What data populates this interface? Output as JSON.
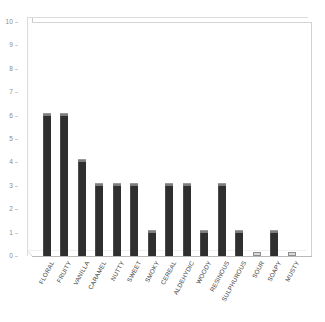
{
  "chart_data": {
    "type": "bar",
    "title": "",
    "subtitle": "",
    "xlabel": "",
    "ylabel": "",
    "ylim": [
      0,
      10
    ],
    "ytick_step": 1,
    "yticks": [
      0,
      1,
      2,
      3,
      4,
      5,
      6,
      7,
      8,
      9,
      10
    ],
    "ytick_labels": [
      "0",
      "1",
      "2",
      "3",
      "4",
      "5",
      "6",
      "7",
      "8",
      "9",
      "10"
    ],
    "grid": false,
    "legend": false,
    "legend_position": "none",
    "style": "3d-column",
    "bar_color": "#2f2f2f",
    "bar_highlight_color": "#7d7d7d",
    "axis_color": "#cfcfcf",
    "tick_label_color": "#8a8a8a",
    "category_label_color": "#3a3a3a",
    "background_color": "#ffffff",
    "category_label_rotation": -62,
    "categories": [
      "FLORAL",
      "FRUITY",
      "VANILLA",
      "CARAMEL",
      "NUTTY",
      "SWEET",
      "SMOKY",
      "CEREAL",
      "ALDEHYDIC",
      "WOODY",
      "RESINOUS",
      "SULPHUROUS",
      "SOUR",
      "SOAPY",
      "MUSTY"
    ],
    "values": [
      6,
      6,
      4,
      3,
      3,
      3,
      1,
      3,
      3,
      1,
      3,
      1,
      0,
      1,
      0
    ]
  }
}
